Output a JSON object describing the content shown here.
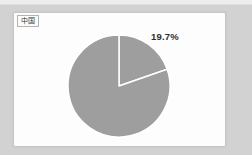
{
  "legend": {
    "label": "中国"
  },
  "chart_data": {
    "type": "pie",
    "title": "",
    "legend_entries": [
      "中国"
    ],
    "start_angle_deg": 0,
    "direction": "clockwise",
    "slices": [
      {
        "label": "19.7%",
        "value": 19.7,
        "color": "#9e9e9e"
      },
      {
        "label": "",
        "value": 80.3,
        "color": "#9e9e9e"
      }
    ],
    "separator_color": "#ffffff",
    "label_position": "outside",
    "legend_position": "top-left"
  },
  "colors": {
    "background": "#d2d2d2",
    "top_strip": "#eeeeee",
    "panel_background": "#fdfdfd",
    "panel_border": "#c6c6c6",
    "pie_fill": "#9e9e9e",
    "label_text": "#2e2e2e"
  }
}
